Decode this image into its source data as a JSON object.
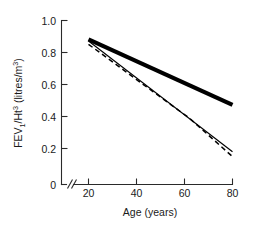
{
  "chart_data": {
    "type": "line",
    "title": "",
    "xlabel": "Age (years)",
    "ylabel": "FEV1/Ht3 (litres/m3)",
    "ylabel_parts": {
      "lead": "FEV",
      "sub1": "1",
      "mid": "/Ht",
      "sup1": "3",
      "tail": " (litres/m",
      "sup2": "3",
      "close": ")"
    },
    "xlim": [
      20,
      80
    ],
    "ylim": [
      0,
      1.0
    ],
    "x_ticks": [
      20,
      40,
      60,
      80
    ],
    "x_tick_labels": [
      "20",
      "40",
      "60",
      "80"
    ],
    "y_ticks": [
      0,
      0.2,
      0.4,
      0.6,
      0.8,
      1.0
    ],
    "y_tick_labels": [
      "0",
      "0.2",
      "0.4",
      "0.6",
      "0.8",
      "1.0"
    ],
    "origin_label": "0",
    "axis_break": {
      "present": true,
      "glyph": "//",
      "axis": "x",
      "between": [
        0,
        20
      ]
    },
    "grid": false,
    "legend": "none",
    "series": [
      {
        "name": "thick-solid-upper",
        "style": "solid-thick",
        "color": "#000000",
        "x": [
          20,
          80
        ],
        "values": [
          0.885,
          0.485
        ]
      },
      {
        "name": "thin-solid-lower",
        "style": "solid-thin",
        "color": "#000000",
        "x": [
          20,
          80
        ],
        "values": [
          0.875,
          0.2
        ]
      },
      {
        "name": "dashed-lower",
        "style": "dashed",
        "color": "#000000",
        "x": [
          20,
          47,
          62,
          80
        ],
        "values": [
          0.855,
          0.565,
          0.405,
          0.17
        ]
      }
    ]
  },
  "colors": {
    "ink": "#000000",
    "axis": "#2a2a2a",
    "background": "#ffffff"
  }
}
